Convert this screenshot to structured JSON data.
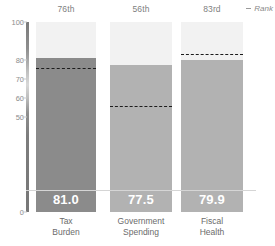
{
  "chart_data": {
    "type": "bar",
    "title": "",
    "subtitle": "",
    "xlabel": "",
    "ylabel": "",
    "ylim": [
      0,
      100
    ],
    "yticks": [
      100,
      80,
      70,
      60,
      50,
      0
    ],
    "ytick_labels": [
      "100",
      "80",
      "70",
      "60",
      "50",
      "0"
    ],
    "grid": false,
    "legend_position": "top-right",
    "categories": [
      "Tax Burden",
      "Government Spending",
      "Fiscal Health"
    ],
    "values": [
      81.0,
      77.5,
      79.9
    ],
    "value_labels": [
      "81.0",
      "77.5",
      "79.9"
    ],
    "ranks": [
      "76th",
      "56th",
      "83rd"
    ],
    "rank_values": [
      76,
      56,
      83
    ],
    "series": [
      {
        "name": "Score",
        "values": [
          81.0,
          77.5,
          79.9
        ]
      },
      {
        "name": "Rank",
        "values": [
          76,
          56,
          83
        ]
      }
    ],
    "annotations": []
  },
  "legend": {
    "marker": "dashed-line-marker",
    "label": "Rank"
  },
  "colors": {
    "bar_primary": "#8b8b8b",
    "bar_secondary": "#b2b2b2",
    "bar_track": "#f2f2f2",
    "dash_line": "#1c1c1c",
    "axis_text": "#8c8c8c",
    "label_text": "#6b6b6b",
    "background": "#ffffff"
  },
  "axis": {
    "ticks": [
      {
        "label": "100",
        "value": 100
      },
      {
        "label": "80",
        "value": 80
      },
      {
        "label": "70",
        "value": 70
      },
      {
        "label": "60",
        "value": 60
      },
      {
        "label": "50",
        "value": 50
      },
      {
        "label": "0",
        "value": 0
      }
    ]
  },
  "bars": [
    {
      "name": "Tax Burden",
      "label_line1": "Tax",
      "label_line2": "Burden",
      "value": 81.0,
      "value_label": "81.0",
      "rank": "76th",
      "rank_value": 76,
      "color": "#8b8b8b"
    },
    {
      "name": "Government Spending",
      "label_line1": "Government",
      "label_line2": "Spending",
      "value": 77.5,
      "value_label": "77.5",
      "rank": "56th",
      "rank_value": 56,
      "color": "#b2b2b2"
    },
    {
      "name": "Fiscal Health",
      "label_line1": "Fiscal",
      "label_line2": "Health",
      "value": 79.9,
      "value_label": "79.9",
      "rank": "83rd",
      "rank_value": 83,
      "color": "#b2b2b2"
    }
  ]
}
